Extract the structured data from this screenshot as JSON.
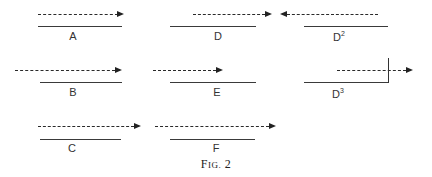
{
  "figure": {
    "caption_prefix": "F",
    "caption_smallcaps": "IG.",
    "caption_number": "2"
  },
  "panels": [
    {
      "id": "A",
      "label": "A",
      "superscript": ""
    },
    {
      "id": "D",
      "label": "D",
      "superscript": ""
    },
    {
      "id": "D2",
      "label": "D",
      "superscript": "2"
    },
    {
      "id": "B",
      "label": "B",
      "superscript": ""
    },
    {
      "id": "E",
      "label": "E",
      "superscript": ""
    },
    {
      "id": "D3",
      "label": "D",
      "superscript": "3"
    },
    {
      "id": "C",
      "label": "C",
      "superscript": ""
    },
    {
      "id": "F",
      "label": "F",
      "superscript": ""
    }
  ],
  "colors": {
    "line": "#333333",
    "background": "#ffffff"
  }
}
